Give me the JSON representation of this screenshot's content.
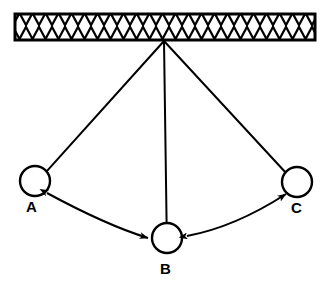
{
  "diagram": {
    "canvas": {
      "width": 331,
      "height": 291,
      "background": "#ffffff"
    },
    "stroke_color": "#000000",
    "support": {
      "name": "ceiling-support-bar",
      "label": "hatched ceiling support",
      "x": 15,
      "y": 14,
      "width": 300,
      "height": 26,
      "hatch_pattern": "crosshatch-x",
      "hatch_spacing": 13,
      "border_width": 2.5
    },
    "pivot": {
      "name": "pivot-point",
      "x": 164,
      "y": 41
    },
    "bobs": [
      {
        "id": "A",
        "label": "A",
        "cx": 35,
        "cy": 181,
        "r": 15,
        "label_x": 26,
        "label_y": 212,
        "string_attach_angle_deg": -45
      },
      {
        "id": "B",
        "label": "B",
        "cx": 167,
        "cy": 238,
        "r": 15,
        "label_x": 160,
        "label_y": 274,
        "string_attach_angle_deg": -90
      },
      {
        "id": "C",
        "label": "C",
        "cx": 297,
        "cy": 182,
        "r": 15,
        "label_x": 291,
        "label_y": 213,
        "string_attach_angle_deg": -135
      }
    ],
    "strings": [
      {
        "name": "string-pivot-to-a",
        "from": "pivot",
        "to": "A"
      },
      {
        "name": "string-pivot-to-b",
        "from": "pivot",
        "to": "B"
      },
      {
        "name": "string-pivot-to-c",
        "from": "pivot",
        "to": "C"
      }
    ],
    "arrows": [
      {
        "name": "arrow-a-b",
        "from": "A",
        "to": "B",
        "double_headed": true,
        "curve": "arc-below",
        "label": ""
      },
      {
        "name": "arrow-b-c",
        "from": "B",
        "to": "C",
        "double_headed": true,
        "curve": "arc-below",
        "label": ""
      }
    ],
    "line_width": 2
  }
}
